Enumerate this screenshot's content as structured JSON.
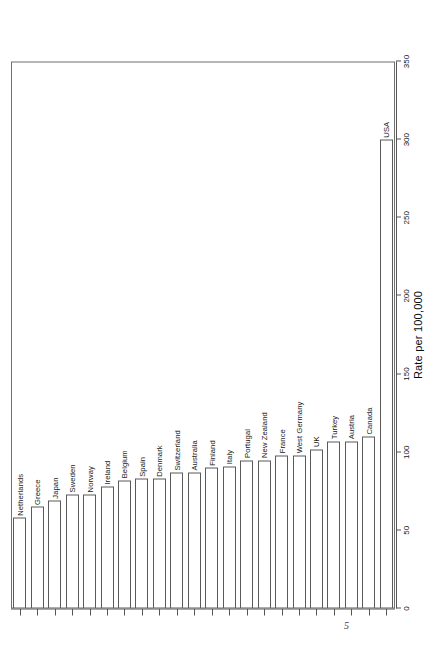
{
  "page": {
    "folio": "5"
  },
  "chart_data": {
    "type": "bar",
    "orientation": "horizontal",
    "title": "",
    "subtitle": "",
    "xlabel": "Rate per 100,000",
    "ylabel": "",
    "axis_label": "Rate per 100,000",
    "xlim": [
      0,
      350
    ],
    "grid": false,
    "legend": null,
    "tick_labels": [
      "0",
      "50",
      "100",
      "150",
      "200",
      "250",
      "300",
      "350"
    ],
    "ticks": [
      0,
      50,
      100,
      150,
      200,
      250,
      300,
      350
    ],
    "categories": [
      "Netherlands",
      "Greece",
      "Japan",
      "Sweden",
      "Norway",
      "Ireland",
      "Belgium",
      "Spain",
      "Denmark",
      "Switzerland",
      "Australia",
      "Finland",
      "Italy",
      "Portugal",
      "New Zealand",
      "France",
      "West Germany",
      "UK",
      "Turkey",
      "Austria",
      "Canada",
      "USA"
    ],
    "values": [
      58,
      65,
      69,
      73,
      73,
      78,
      82,
      83,
      83,
      87,
      87,
      90,
      91,
      95,
      95,
      98,
      98,
      102,
      107,
      107,
      110,
      300
    ],
    "series": [
      {
        "name": "Rate per 100,000",
        "values": [
          58,
          65,
          69,
          73,
          73,
          78,
          82,
          83,
          83,
          87,
          87,
          90,
          91,
          95,
          95,
          98,
          98,
          102,
          107,
          107,
          110,
          300
        ]
      }
    ],
    "colors": {
      "bar_fill": "#ffffff",
      "bar_stroke": "#5a5a5a",
      "axis": "#555555",
      "text": "#141414"
    }
  }
}
